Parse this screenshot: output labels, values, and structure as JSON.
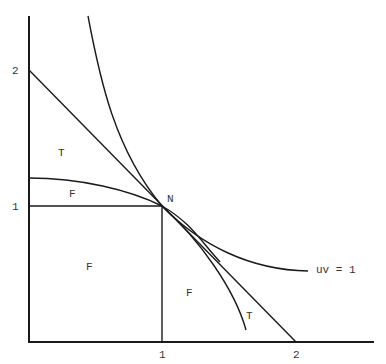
{
  "diagram": {
    "type": "function-diagram",
    "axes": {
      "x_ticks": [
        {
          "label": "1",
          "value": 1
        },
        {
          "label": "2",
          "value": 2
        }
      ],
      "y_ticks": [
        {
          "label": "1",
          "value": 1
        },
        {
          "label": "2",
          "value": 2
        }
      ]
    },
    "point": {
      "label": "N",
      "x": 1,
      "y": 1
    },
    "curve_label": "uv = 1",
    "region_labels": {
      "t_upper": "T",
      "f_upper": "F",
      "f_square": "F",
      "f_right": "F",
      "t_lower": "T"
    },
    "elements": [
      "hyperbola uv = 1",
      "tangent line u + v = 2",
      "concave curve through N (F boundary)",
      "convex curve through N (T boundary)",
      "unit square from origin to N"
    ]
  }
}
